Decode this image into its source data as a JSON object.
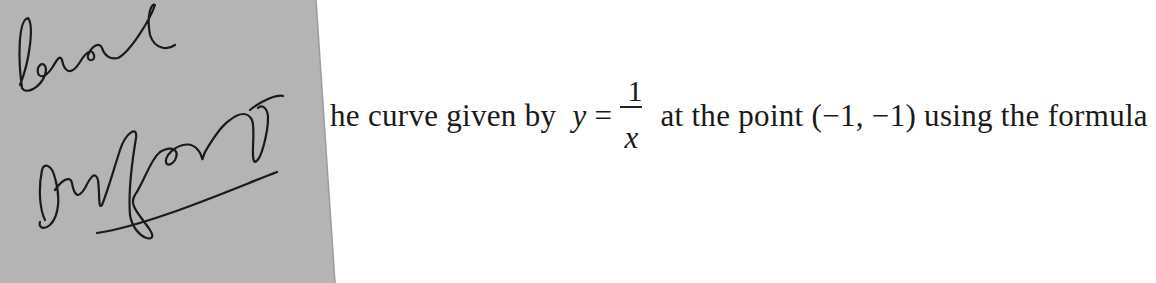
{
  "document": {
    "text_before_math": "he curve given by",
    "math": {
      "lhs": "y",
      "equals": "=",
      "numerator": "1",
      "denominator": "x"
    },
    "text_after_math": "at the point (−1, −1) using the formula"
  },
  "handwritten_note": {
    "line1": "level",
    "line2": "surface",
    "underlined": true
  },
  "colors": {
    "paper_overlay": "#b4b4b4",
    "ink": "#1a1a1a",
    "background": "#ffffff"
  }
}
